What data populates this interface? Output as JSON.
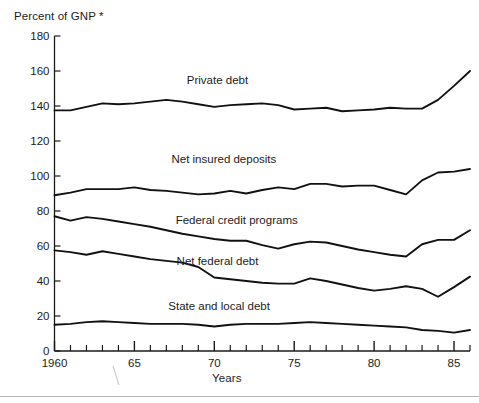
{
  "figure": {
    "ylabel": "Percent of GNP *",
    "xlabel": "Years"
  },
  "chart_data": {
    "type": "line",
    "title": "",
    "subtitle": "",
    "xlabel": "Years",
    "ylabel": "Percent of GNP *",
    "xlim": [
      1960,
      1986
    ],
    "ylim": [
      0,
      180
    ],
    "ytick_values": [
      0,
      20,
      40,
      60,
      80,
      100,
      120,
      140,
      160,
      180
    ],
    "ytick_labels": [
      "0",
      "20",
      "40",
      "60",
      "80",
      "100",
      "120",
      "140",
      "160",
      "180"
    ],
    "xtick_values": [
      1960,
      1961,
      1962,
      1963,
      1964,
      1965,
      1966,
      1967,
      1968,
      1969,
      1970,
      1971,
      1972,
      1973,
      1974,
      1975,
      1976,
      1977,
      1978,
      1979,
      1980,
      1981,
      1982,
      1983,
      1984,
      1985,
      1986
    ],
    "xtick_labeled": [
      {
        "value": 1960,
        "label": "1960"
      },
      {
        "value": 1965,
        "label": "65"
      },
      {
        "value": 1970,
        "label": "70"
      },
      {
        "value": 1975,
        "label": "75"
      },
      {
        "value": 1980,
        "label": "80"
      },
      {
        "value": 1985,
        "label": "85"
      }
    ],
    "grid": false,
    "legend_position": "inline-labels",
    "x": [
      1960,
      1961,
      1962,
      1963,
      1964,
      1965,
      1966,
      1967,
      1968,
      1969,
      1970,
      1971,
      1972,
      1973,
      1974,
      1975,
      1976,
      1977,
      1978,
      1979,
      1980,
      1981,
      1982,
      1983,
      1984,
      1985,
      1986
    ],
    "series": [
      {
        "name": "Private debt",
        "label": "Private debt",
        "label_x": 1970.2,
        "label_y": 152.5,
        "values": [
          137.5,
          137.5,
          139.5,
          141.5,
          141.0,
          141.5,
          142.5,
          143.5,
          142.5,
          141.0,
          139.5,
          140.5,
          141.0,
          141.5,
          140.5,
          138.0,
          138.5,
          139.0,
          137.0,
          137.5,
          138.0,
          139.0,
          138.5,
          138.5,
          143.5,
          151.5,
          160.0
        ]
      },
      {
        "name": "Net insured deposits",
        "label": "Net insured deposits",
        "label_x": 1970.6,
        "label_y": 107.5,
        "values": [
          89.0,
          90.5,
          92.5,
          92.5,
          92.5,
          93.5,
          92.0,
          91.5,
          90.5,
          89.5,
          90.0,
          91.5,
          90.0,
          92.0,
          93.5,
          92.5,
          95.5,
          95.5,
          94.0,
          94.5,
          94.5,
          92.0,
          89.5,
          97.5,
          102.0,
          102.5,
          104.0
        ]
      },
      {
        "name": "Federal credit programs",
        "label": "Federal credit programs",
        "label_x": 1971.4,
        "label_y": 72.5,
        "values": [
          77.0,
          74.5,
          76.5,
          75.5,
          74.0,
          72.5,
          71.0,
          69.0,
          67.0,
          65.5,
          64.0,
          63.0,
          63.0,
          60.5,
          58.5,
          61.0,
          62.5,
          62.0,
          60.0,
          58.0,
          56.5,
          55.0,
          54.0,
          61.0,
          63.5,
          63.5,
          69.0
        ]
      },
      {
        "name": "Net federal debt",
        "label": "Net federal debt",
        "label_x": 1970.2,
        "label_y": 49.0,
        "values": [
          57.5,
          56.5,
          55.0,
          57.0,
          55.5,
          54.0,
          52.5,
          51.5,
          50.5,
          48.0,
          42.0,
          41.0,
          40.0,
          39.0,
          38.5,
          38.5,
          41.5,
          40.0,
          38.0,
          36.0,
          34.5,
          35.5,
          37.0,
          35.5,
          31.0,
          36.5,
          42.5
        ]
      },
      {
        "name": "State and local debt",
        "label": "State and local debt",
        "label_x": 1970.3,
        "label_y": 23.5,
        "values": [
          15.0,
          15.5,
          16.5,
          17.0,
          16.5,
          16.0,
          15.5,
          15.5,
          15.5,
          15.0,
          14.0,
          15.0,
          15.5,
          15.5,
          15.5,
          16.0,
          16.5,
          16.0,
          15.5,
          15.0,
          14.5,
          14.0,
          13.5,
          12.0,
          11.5,
          10.5,
          12.0
        ]
      }
    ]
  }
}
